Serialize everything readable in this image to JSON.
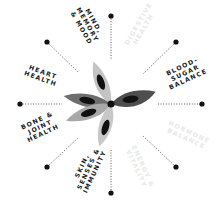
{
  "diagram": {
    "title": "",
    "colors": {
      "background": "#ffffff",
      "petal_light": "#bdbdbd",
      "petal_mid": "#9a9a9a",
      "petal_dark": "#6a6a6a",
      "petal_darker": "#4a4a4a",
      "spot": "#111111",
      "center": "#111111",
      "spoke": "#333333",
      "label_dark": "#1a1a1a",
      "label_faint": "#e8e8e8"
    },
    "labels": [
      {
        "id": "mind-memory-mood",
        "text": "MIND,\nMEMORY\n& MOOD",
        "active": true
      },
      {
        "id": "digestive-health",
        "text": "DIGESTIVE\nHEALTH",
        "active": false
      },
      {
        "id": "blood-sugar-balance",
        "text": "BLOOD-\nSUGAR\nBALANCE",
        "active": true
      },
      {
        "id": "hormone-balance",
        "text": "HORMONE\nBALANCE",
        "active": false
      },
      {
        "id": "energy-vitality",
        "text": "ENERGY &\nVITALITY",
        "active": false
      },
      {
        "id": "skin-senses-immunity",
        "text": "SKIN,\nSENSES &\nIMMUNITY",
        "active": true
      },
      {
        "id": "bone-joint-health",
        "text": "BONE &\nJOINT\nHEALTH",
        "active": true
      },
      {
        "id": "heart-health",
        "text": "HEART\nHEALTH",
        "active": true
      }
    ]
  }
}
